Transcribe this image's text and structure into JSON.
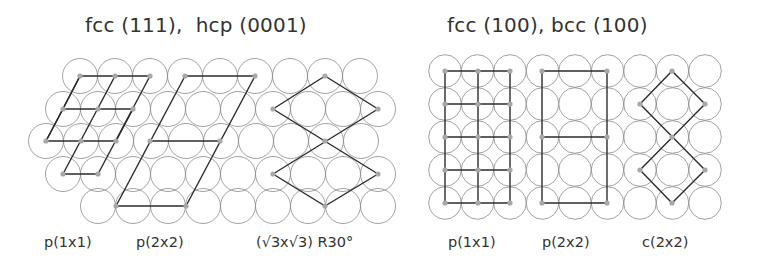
{
  "panels": [
    {
      "id": "hexagonal",
      "title": "fcc (111),  hcp (0001)",
      "labels": [
        "p(1x1)",
        "p(2x2)",
        "(√3x√3) R30°"
      ]
    },
    {
      "id": "square",
      "title": "fcc (100), bcc (100)",
      "labels": [
        "p(1x1)",
        "p(2x2)",
        "c(2x2)"
      ]
    }
  ],
  "colors": {
    "circle_stroke": "#8a8a8a",
    "cell_line": "#2b2b2b",
    "adsorbate_dot": "#a8a8a8",
    "text": "#333333"
  }
}
